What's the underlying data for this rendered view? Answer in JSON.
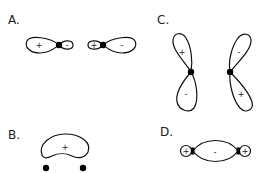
{
  "panels": {
    "A": {
      "label": "A.",
      "orbital_1": {
        "large_lobe_sign": "+",
        "small_lobe_sign": "-"
      },
      "orbital_2": {
        "small_lobe_sign": "+",
        "large_lobe_sign": "-"
      }
    },
    "B": {
      "label": "B.",
      "lobe_sign": "+",
      "nuclei_count": 2
    },
    "C": {
      "label": "C.",
      "left": {
        "upper_sign": "+",
        "lower_sign": "-"
      },
      "right": {
        "upper_sign": "-",
        "lower_sign": "+"
      }
    },
    "D": {
      "label": "D.",
      "left_sign": "+",
      "center_sign": "-",
      "right_sign": "+"
    }
  },
  "colors": {
    "stroke": "#111111",
    "node": "#000000",
    "background": "#ffffff"
  }
}
